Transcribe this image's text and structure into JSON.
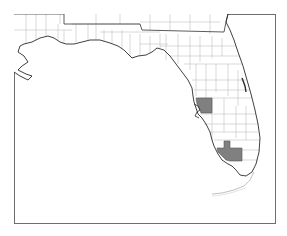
{
  "map": {
    "region": "Florida",
    "subdivision": "counties",
    "colors": {
      "background": "#ffffff",
      "frame": "#6e6e6e",
      "coastline": "#2a2a2a",
      "state_border": "#4a4a4a",
      "county_border": "#c8c8c8",
      "highlight_fill": "#808080"
    },
    "highlighted_counties": [
      {
        "name": "Hillsborough",
        "area": "Tampa Bay"
      },
      {
        "name": "Collier",
        "area": "Southwest Florida"
      }
    ]
  }
}
